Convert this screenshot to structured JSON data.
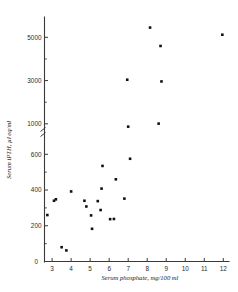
{
  "figure": {
    "title": "",
    "background_color": "#ffffff",
    "ink_color": "#111111"
  },
  "axes": {
    "x": {
      "label": "Serum phosphate, mg/100 ml",
      "ticks": [
        "3",
        "4",
        "5",
        "6",
        "7",
        "8",
        "9",
        "10",
        "11",
        "12"
      ],
      "tick_values": [
        3,
        4,
        5,
        6,
        7,
        8,
        9,
        10,
        11,
        12
      ],
      "min": 2.6,
      "max": 12.3
    },
    "y": {
      "label": "Serum iPTH, µl eq/ml",
      "origin_label": "0",
      "lower_ticks": [
        "200",
        "400",
        "600"
      ],
      "lower_tick_values": [
        200,
        400,
        600
      ],
      "lower_minor_values": [
        100,
        300,
        500
      ],
      "upper_ticks": [
        "1000",
        "3000",
        "5000"
      ],
      "upper_tick_values": [
        1000,
        3000,
        5000
      ],
      "upper_minor_values": [
        2000,
        4000
      ],
      "axis_break": true,
      "axis_break_between": [
        600,
        1000
      ],
      "lower_min": 0,
      "lower_max": 680,
      "upper_min": 900,
      "upper_max": 5800
    }
  },
  "chart_data": {
    "type": "scatter",
    "title": "",
    "xlabel": "Serum phosphate, mg/100 ml",
    "ylabel": "Serum iPTH, µl eq/ml",
    "xlim": [
      2.6,
      12.3
    ],
    "ylim": [
      0,
      5800
    ],
    "grid": false,
    "legend": "none",
    "axis_break": {
      "enabled": true,
      "from": 600,
      "to": 1000
    },
    "marker": {
      "shape": "square",
      "size": 2.6,
      "color": "#111111"
    },
    "x": [
      2.75,
      3.1,
      3.2,
      3.5,
      3.75,
      4.0,
      4.7,
      4.8,
      5.05,
      5.1,
      5.4,
      5.55,
      5.6,
      5.65,
      6.05,
      6.25,
      6.35,
      6.8,
      7.0,
      7.1,
      7.15,
      6.95,
      8.15,
      8.6,
      8.7,
      8.75,
      11.95
    ],
    "y": [
      260,
      340,
      348,
      80,
      62,
      392,
      340,
      308,
      258,
      183,
      338,
      288,
      408,
      535,
      237,
      238,
      460,
      352,
      870,
      575,
      3040,
      3040,
      5450,
      1010,
      4600,
      2960,
      5120
    ],
    "points": [
      {
        "x": 2.75,
        "y": 260
      },
      {
        "x": 3.1,
        "y": 340
      },
      {
        "x": 3.2,
        "y": 348
      },
      {
        "x": 3.5,
        "y": 80
      },
      {
        "x": 3.75,
        "y": 62
      },
      {
        "x": 4.0,
        "y": 392
      },
      {
        "x": 4.7,
        "y": 340
      },
      {
        "x": 4.8,
        "y": 308
      },
      {
        "x": 5.05,
        "y": 258
      },
      {
        "x": 5.1,
        "y": 183
      },
      {
        "x": 5.4,
        "y": 338
      },
      {
        "x": 5.55,
        "y": 288
      },
      {
        "x": 5.6,
        "y": 408
      },
      {
        "x": 5.65,
        "y": 535
      },
      {
        "x": 6.05,
        "y": 237
      },
      {
        "x": 6.25,
        "y": 238
      },
      {
        "x": 6.35,
        "y": 460
      },
      {
        "x": 6.8,
        "y": 352
      },
      {
        "x": 7.0,
        "y": 870
      },
      {
        "x": 7.1,
        "y": 575
      },
      {
        "x": 6.95,
        "y": 3040
      },
      {
        "x": 8.15,
        "y": 5450
      },
      {
        "x": 8.6,
        "y": 1010
      },
      {
        "x": 8.7,
        "y": 4600
      },
      {
        "x": 8.75,
        "y": 2960
      },
      {
        "x": 11.95,
        "y": 5120
      }
    ]
  }
}
